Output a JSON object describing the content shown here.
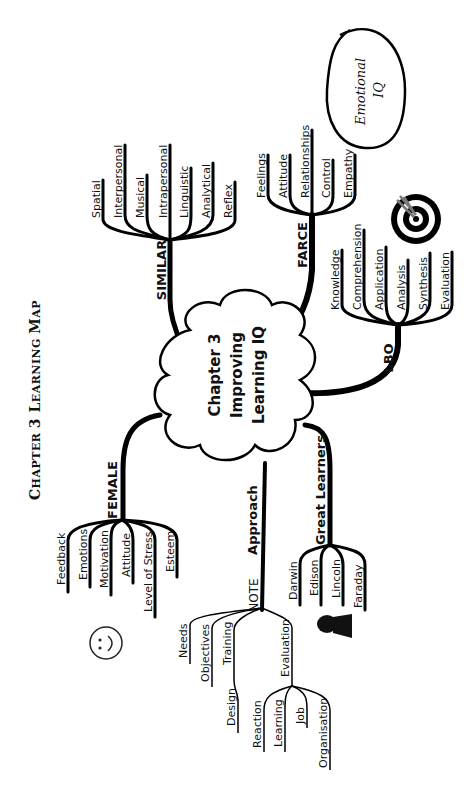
{
  "page_title": {
    "big1": "C",
    "small1": "HAPTER ",
    "mid": "3 ",
    "big2": "L",
    "small2": "EARNING ",
    "big3": "M",
    "small3": "AP"
  },
  "center": {
    "line1": "Chapter 3",
    "line2": "Improving",
    "line3": "Learning IQ"
  },
  "branches": {
    "similar": {
      "label": "SIMILAR",
      "leaves": [
        "Spatial",
        "Interpersonal",
        "Musical",
        "Intrapersonal",
        "Linguistic",
        "Analytical",
        "Reflex"
      ]
    },
    "farce": {
      "label": "FARCE",
      "leaves": [
        "Feelings",
        "Attitude",
        "Relationships",
        "Control",
        "Empathy"
      ]
    },
    "lbo": {
      "label": "LBO",
      "leaves": [
        "Knowledge",
        "Comprehension",
        "Application",
        "Analysis",
        "Synthesis",
        "Evaluation"
      ]
    },
    "female": {
      "label": "FEMALE",
      "leaves": [
        "Feedback",
        "Emotions",
        "Motivation",
        "Attitude",
        "Level of Stress",
        "Esteem"
      ]
    },
    "approach": {
      "label": "Approach",
      "sub_label": "NOTE",
      "leaves": [
        "Needs",
        "Objectives",
        "Training",
        "Design"
      ],
      "evaluation": {
        "label": "Evaluation",
        "leaves": [
          "Reaction",
          "Learning",
          "Job",
          "Organisation"
        ]
      }
    },
    "great_learners": {
      "label": "Great Learners",
      "leaves": [
        "Darwin",
        "Edison",
        "Lincoln",
        "Faraday"
      ]
    }
  },
  "emotional_iq": {
    "line1": "Emotional",
    "line2": "IQ"
  },
  "icons": [
    "smiley-face-icon",
    "target-bullseye-icon",
    "lincoln-bust-icon"
  ]
}
